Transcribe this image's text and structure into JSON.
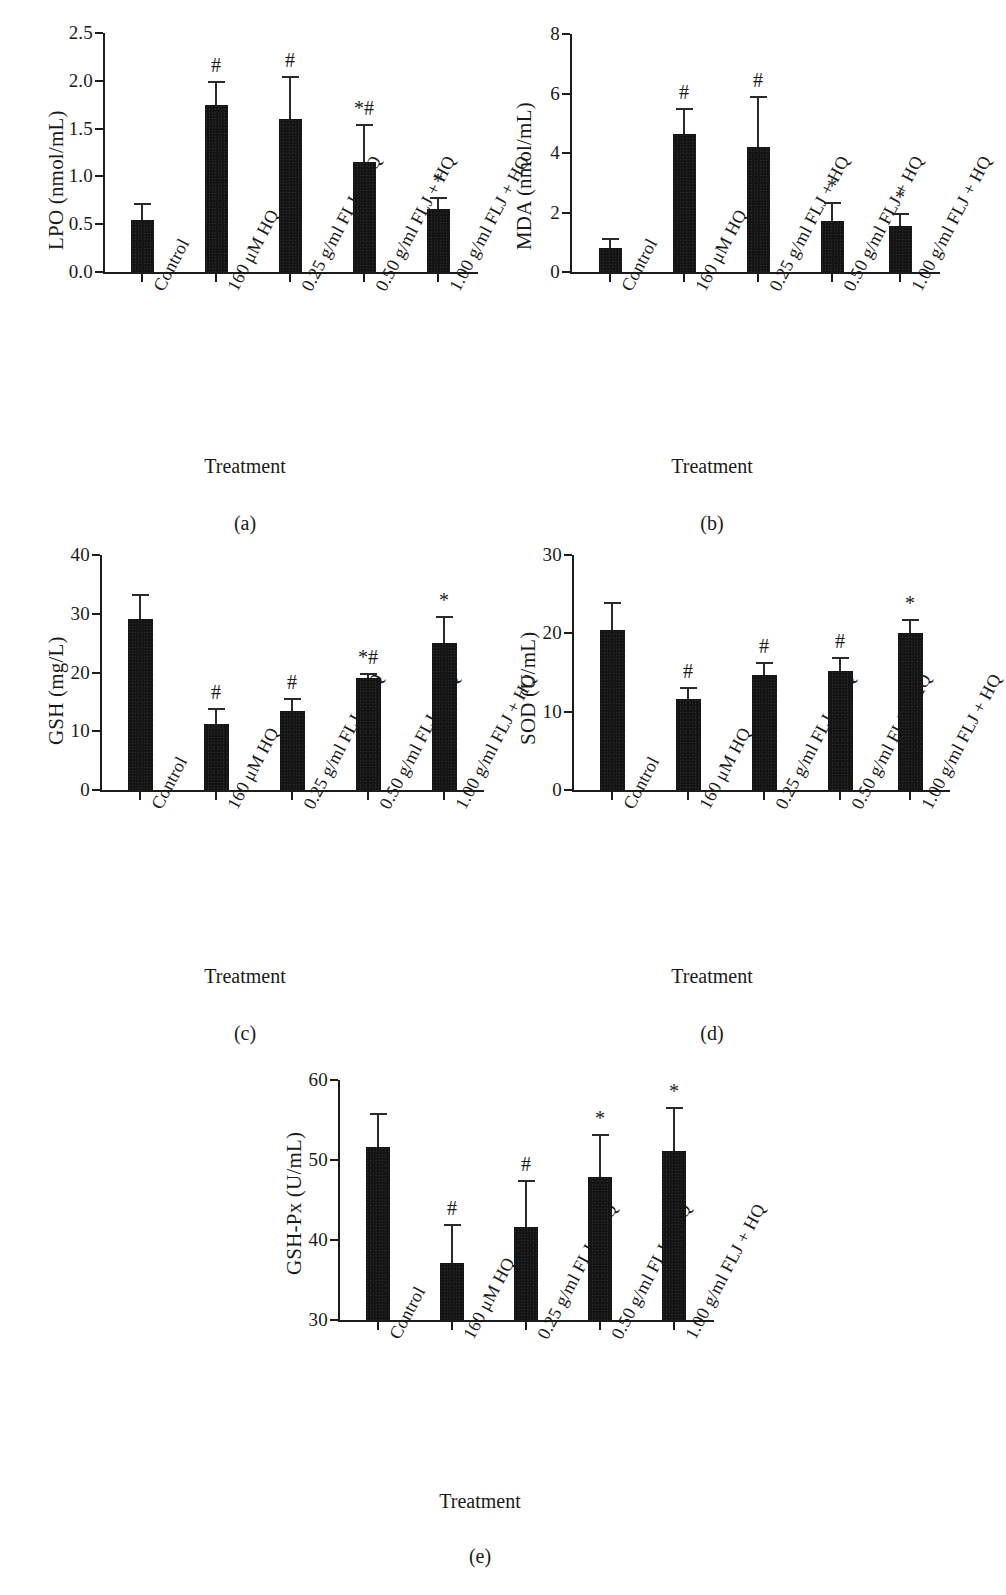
{
  "figure": {
    "categories": [
      "Control",
      "160 μM HQ",
      "0.25 g/ml FLJ + HQ",
      "0.50 g/ml FLJ + HQ",
      "1.00 g/ml FLJ + HQ"
    ],
    "xlabel": "Treatment",
    "panel_captions": [
      "(a)",
      "(b)",
      "(c)",
      "(d)",
      "(e)"
    ],
    "bar_color": "#141414",
    "axis_color": "#1c1c1c"
  },
  "chart_data": [
    {
      "panel": "(a)",
      "type": "bar",
      "title": "",
      "ylabel": "LPO (nmol/mL)",
      "xlabel": "Treatment",
      "categories": [
        "Control",
        "160 μM HQ",
        "0.25 g/ml FLJ + HQ",
        "0.50 g/ml FLJ + HQ",
        "1.00 g/ml FLJ + HQ"
      ],
      "values": [
        0.54,
        1.75,
        1.6,
        1.15,
        0.66
      ],
      "errors": [
        0.18,
        0.25,
        0.45,
        0.4,
        0.12
      ],
      "annotations": [
        "",
        "#",
        "#",
        "*#",
        "*"
      ],
      "ylim": [
        0.0,
        2.5
      ],
      "yticks": [
        "0.0",
        "0.5",
        "1.0",
        "1.5",
        "2.0",
        "2.5"
      ],
      "ytick_values": [
        0.0,
        0.5,
        1.0,
        1.5,
        2.0,
        2.5
      ],
      "grid": false,
      "legend": "none"
    },
    {
      "panel": "(b)",
      "type": "bar",
      "title": "",
      "ylabel": "MDA (nmol/mL)",
      "xlabel": "Treatment",
      "categories": [
        "Control",
        "160 μM HQ",
        "0.25 g/ml FLJ + HQ",
        "0.50 g/ml FLJ + HQ",
        "1.00 g/ml FLJ + HQ"
      ],
      "values": [
        0.8,
        4.65,
        4.2,
        1.7,
        1.55
      ],
      "errors": [
        0.35,
        0.85,
        1.7,
        0.65,
        0.45
      ],
      "annotations": [
        "",
        "#",
        "#",
        "*",
        "*"
      ],
      "ylim": [
        0,
        8
      ],
      "yticks": [
        "0",
        "2",
        "4",
        "6",
        "8"
      ],
      "ytick_values": [
        0,
        2,
        4,
        6,
        8
      ],
      "grid": false,
      "legend": "none"
    },
    {
      "panel": "(c)",
      "type": "bar",
      "title": "",
      "ylabel": "GSH (mg/L)",
      "xlabel": "Treatment",
      "categories": [
        "Control",
        "160 μM HQ",
        "0.25 g/ml FLJ + HQ",
        "0.50 g/ml FLJ + HQ",
        "1.00 g/ml FLJ + HQ"
      ],
      "values": [
        29.1,
        11.3,
        13.5,
        19.0,
        25.1
      ],
      "errors": [
        4.3,
        2.6,
        2.2,
        0.9,
        4.6
      ],
      "annotations": [
        "",
        "#",
        "#",
        "*#",
        "*"
      ],
      "ylim": [
        0,
        40
      ],
      "yticks": [
        "0",
        "10",
        "20",
        "30",
        "40"
      ],
      "ytick_values": [
        0,
        10,
        20,
        30,
        40
      ],
      "grid": false,
      "legend": "none"
    },
    {
      "panel": "(d)",
      "type": "bar",
      "title": "",
      "ylabel": "SOD (U/mL)",
      "xlabel": "Treatment",
      "categories": [
        "Control",
        "160 μM HQ",
        "0.25 g/ml FLJ + HQ",
        "0.50 g/ml FLJ + HQ",
        "1.00 g/ml FLJ + HQ"
      ],
      "values": [
        20.4,
        11.6,
        14.7,
        15.2,
        20.0
      ],
      "errors": [
        3.6,
        1.6,
        1.6,
        1.8,
        1.8
      ],
      "annotations": [
        "",
        "#",
        "#",
        "#",
        "*"
      ],
      "ylim": [
        0,
        30
      ],
      "yticks": [
        "0",
        "10",
        "20",
        "30"
      ],
      "ytick_values": [
        0,
        10,
        20,
        30
      ],
      "grid": false,
      "legend": "none"
    },
    {
      "panel": "(e)",
      "type": "bar",
      "title": "",
      "ylabel": "GSH-Px (U/mL)",
      "xlabel": "Treatment",
      "categories": [
        "Control",
        "160 μM HQ",
        "0.25 g/ml FLJ + HQ",
        "0.50 g/ml FLJ + HQ",
        "1.00 g/ml FLJ + HQ"
      ],
      "values": [
        51.6,
        37.1,
        41.6,
        47.9,
        51.1
      ],
      "errors": [
        4.3,
        4.9,
        5.9,
        5.3,
        5.5
      ],
      "annotations": [
        "",
        "#",
        "#",
        "*",
        "*"
      ],
      "ylim": [
        30,
        60
      ],
      "yticks": [
        "30",
        "40",
        "50",
        "60"
      ],
      "ytick_values": [
        30,
        40,
        50,
        60
      ],
      "grid": false,
      "legend": "none"
    }
  ]
}
